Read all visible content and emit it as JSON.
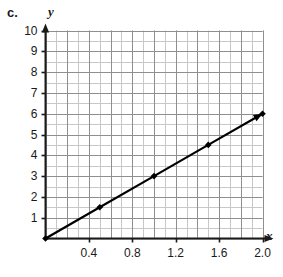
{
  "part_label": "c.",
  "chart_data": {
    "type": "line",
    "title": "",
    "subtitle": "",
    "xlabel": "x",
    "ylabel": "y",
    "xlim": [
      0,
      2.0
    ],
    "ylim": [
      0,
      10
    ],
    "grid": true,
    "legend": "none",
    "x_ticks": [
      "0.4",
      "0.8",
      "1.2",
      "1.6",
      "2.0"
    ],
    "x_tick_values": [
      0.4,
      0.8,
      1.2,
      1.6,
      2.0
    ],
    "y_ticks": [
      "1",
      "2",
      "3",
      "4",
      "5",
      "6",
      "7",
      "8",
      "9",
      "10"
    ],
    "y_tick_values": [
      1,
      2,
      3,
      4,
      5,
      6,
      7,
      8,
      9,
      10
    ],
    "x_minor_step": 0.1,
    "y_minor_step": 0.5,
    "series": [
      {
        "name": "line",
        "color": "#000000",
        "marker": "filled-diamond",
        "arrow_end": true,
        "x": [
          0,
          0.5,
          1.0,
          1.5,
          2.0
        ],
        "values": [
          0,
          1.5,
          3,
          4.5,
          6
        ]
      }
    ],
    "slope": 3,
    "intercept": 0,
    "grid_color": "#c8c8c8",
    "major_grid_color": "#8f8f8f",
    "axis_color": "#1a1a1a"
  }
}
